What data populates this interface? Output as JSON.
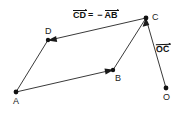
{
  "figure": {
    "type": "vector-diagram",
    "background_color": "#ffffff",
    "stroke_color": "#333333",
    "text_color": "#111111",
    "width": 187,
    "height": 117
  },
  "points": [
    {
      "id": "A",
      "label": "A",
      "x": 16,
      "y": 92,
      "label_x": 13,
      "label_y": 98
    },
    {
      "id": "B",
      "label": "B",
      "x": 113,
      "y": 70,
      "label_x": 114,
      "label_y": 75
    },
    {
      "id": "C",
      "label": "C",
      "x": 146,
      "y": 18,
      "label_x": 152,
      "label_y": 14
    },
    {
      "id": "D",
      "label": "D",
      "x": 48,
      "y": 40,
      "label_x": 45,
      "label_y": 28
    },
    {
      "id": "O",
      "label": "O",
      "x": 166,
      "y": 88,
      "label_x": 163,
      "label_y": 95
    }
  ],
  "segments": [
    {
      "id": "AB",
      "from": "A",
      "to": "B",
      "arrow_at_end": true,
      "name": "segment-ab"
    },
    {
      "id": "CD",
      "from": "C",
      "to": "D",
      "arrow_at_end": true,
      "name": "segment-cd"
    },
    {
      "id": "AD",
      "from": "A",
      "to": "D",
      "arrow_at_end": false,
      "name": "segment-ad"
    },
    {
      "id": "BC",
      "from": "B",
      "to": "C",
      "arrow_at_end": false,
      "name": "segment-bc"
    },
    {
      "id": "OC",
      "from": "O",
      "to": "C",
      "arrow_at_end": true,
      "name": "segment-oc"
    }
  ],
  "annotations": {
    "equation": {
      "lhs": "CD",
      "equals": "=",
      "minus": "−",
      "rhs": "AB",
      "full_text": "CD⃗ = − AB⃗",
      "x": 73,
      "y": 10
    },
    "oc_label": {
      "text": "OC",
      "full_text": "OC⃗",
      "x": 156,
      "y": 44
    }
  }
}
